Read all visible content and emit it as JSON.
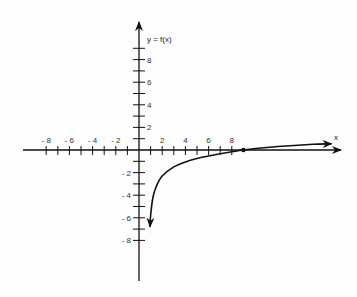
{
  "chart_data": {
    "type": "line",
    "title": "",
    "xlabel": "x",
    "ylabel": "y = f(x)",
    "xlim": [
      -10.3,
      17.7
    ],
    "ylim": [
      -11.5,
      11.3
    ],
    "x_ticks": [
      -8,
      -7,
      -6,
      -5,
      -4,
      -3,
      -2,
      -1,
      1,
      2,
      3,
      4,
      5,
      6,
      7,
      8
    ],
    "x_tick_labels": [
      "- 8",
      "- 6",
      "- 4",
      "- 2",
      "2",
      "4",
      "6",
      "8"
    ],
    "x_tick_label_values": [
      -8,
      -6,
      -4,
      -2,
      2,
      4,
      6,
      8
    ],
    "y_ticks": [
      9,
      8,
      7,
      6,
      5,
      4,
      3,
      2,
      1,
      -1,
      -2,
      -3,
      -4,
      -5,
      -6,
      -7,
      -8
    ],
    "y_tick_labels": [
      "8",
      "6",
      "4",
      "2",
      "- 2",
      "- 4",
      "- 6",
      "- 8"
    ],
    "y_tick_label_values": [
      8,
      6,
      4,
      2,
      -2,
      -4,
      -6,
      -8
    ],
    "grid": false,
    "legend": null,
    "series": [
      {
        "name": "f(x)",
        "description": "logarithmic curve, vertical asymptote at x = 0, crosses x-axis at x = 9, arrows at both ends",
        "x": [
          0.95,
          1,
          1.2,
          1.5,
          2,
          3,
          4,
          5,
          6,
          7,
          8,
          9,
          11,
          13,
          15,
          16.6
        ],
        "y": [
          -6.8,
          -5.8,
          -4.2,
          -3.2,
          -2.3,
          -1.5,
          -1.05,
          -0.75,
          -0.53,
          -0.34,
          -0.16,
          0,
          0.22,
          0.38,
          0.5,
          0.55
        ]
      }
    ],
    "annotations": [
      {
        "type": "point",
        "x": 9,
        "y": 0,
        "label": ""
      }
    ]
  },
  "labels": {
    "y_axis": "y = f(x)",
    "x_axis": "x"
  }
}
